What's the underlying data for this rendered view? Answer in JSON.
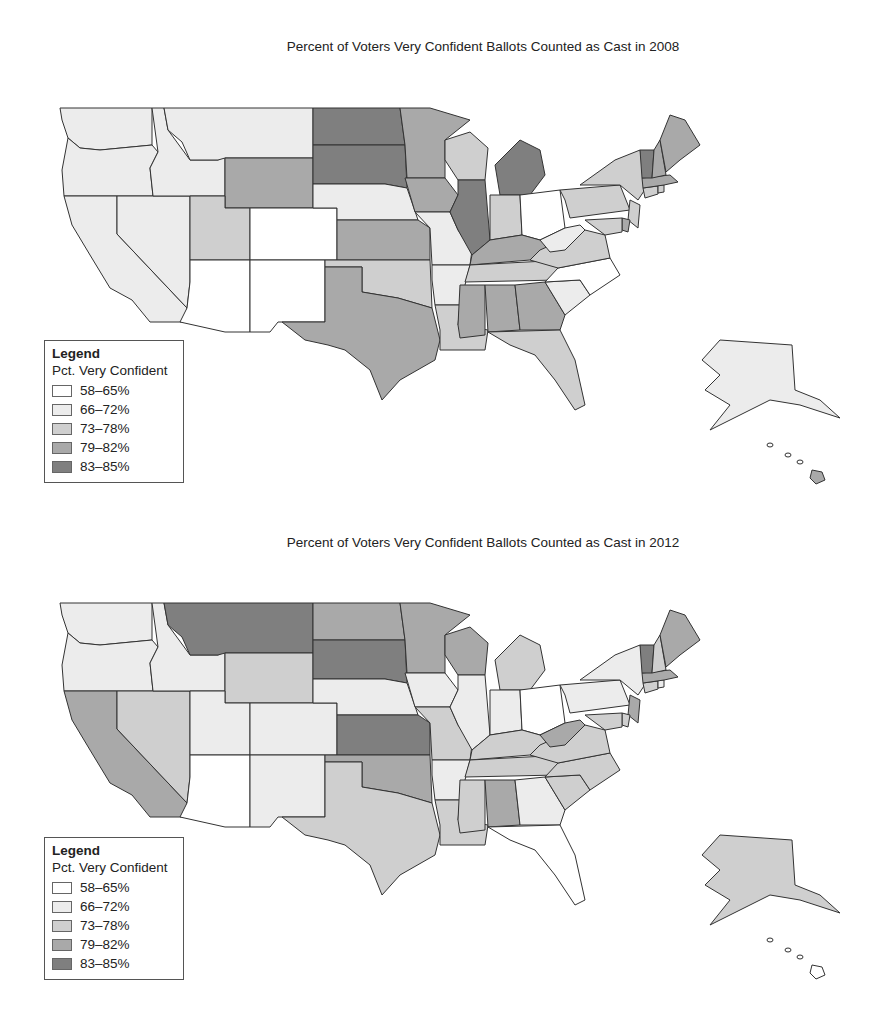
{
  "colors": {
    "c1": "#ffffff",
    "c2": "#ececec",
    "c3": "#cfcfcf",
    "c4": "#a9a9a9",
    "c5": "#7f7f7f",
    "stroke": "#333333"
  },
  "legend": {
    "title": "Legend",
    "subtitle": "Pct. Very Confident",
    "items": [
      {
        "label": "58–65%",
        "cls": "c1"
      },
      {
        "label": "66–72%",
        "cls": "c2"
      },
      {
        "label": "73–78%",
        "cls": "c3"
      },
      {
        "label": "79–82%",
        "cls": "c4"
      },
      {
        "label": "83–85%",
        "cls": "c5"
      }
    ]
  },
  "chart_data": [
    {
      "type": "choropleth",
      "title": "Percent of Voters Very Confident Ballots Counted as Cast in 2008",
      "legend_title": "Legend",
      "legend_subtitle": "Pct. Very Confident",
      "bins": [
        "58–65%",
        "66–72%",
        "73–78%",
        "79–82%",
        "83–85%"
      ],
      "states": {
        "WA": "c2",
        "OR": "c2",
        "CA": "c2",
        "NV": "c2",
        "ID": "c2",
        "MT": "c2",
        "WY": "c4",
        "UT": "c3",
        "CO": "c1",
        "AZ": "c1",
        "NM": "c1",
        "ND": "c5",
        "SD": "c5",
        "NE": "c2",
        "KS": "c4",
        "OK": "c3",
        "TX": "c4",
        "MN": "c4",
        "IA": "c4",
        "MO": "c2",
        "AR": "c2",
        "LA": "c3",
        "WI": "c3",
        "IL": "c5",
        "MI": "c5",
        "IN": "c3",
        "OH": "c1",
        "KY": "c4",
        "TN": "c3",
        "MS": "c4",
        "AL": "c4",
        "GA": "c4",
        "FL": "c3",
        "SC": "c2",
        "NC": "c1",
        "VA": "c3",
        "WV": "c2",
        "PA": "c3",
        "NY": "c3",
        "NJ": "c3",
        "DE": "c4",
        "MD": "c3",
        "CT": "c3",
        "RI": "c3",
        "MA": "c4",
        "VT": "c5",
        "NH": "c4",
        "ME": "c4",
        "AK": "c2",
        "HI": "c4"
      }
    },
    {
      "type": "choropleth",
      "title": "Percent of Voters Very Confident Ballots Counted as Cast in 2012",
      "legend_title": "Legend",
      "legend_subtitle": "Pct. Very Confident",
      "bins": [
        "58–65%",
        "66–72%",
        "73–78%",
        "79–82%",
        "83–85%"
      ],
      "states": {
        "WA": "c2",
        "OR": "c2",
        "CA": "c4",
        "NV": "c3",
        "ID": "c2",
        "MT": "c5",
        "WY": "c3",
        "UT": "c2",
        "CO": "c2",
        "AZ": "c1",
        "NM": "c2",
        "ND": "c4",
        "SD": "c5",
        "NE": "c2",
        "KS": "c5",
        "OK": "c4",
        "TX": "c3",
        "MN": "c4",
        "IA": "c2",
        "MO": "c3",
        "AR": "c2",
        "LA": "c3",
        "WI": "c4",
        "IL": "c2",
        "MI": "c3",
        "IN": "c2",
        "OH": "c1",
        "KY": "c3",
        "TN": "c3",
        "MS": "c3",
        "AL": "c4",
        "GA": "c2",
        "FL": "c1",
        "SC": "c3",
        "NC": "c3",
        "VA": "c3",
        "WV": "c4",
        "PA": "c2",
        "NY": "c2",
        "NJ": "c4",
        "DE": "c3",
        "MD": "c3",
        "CT": "c3",
        "RI": "c2",
        "MA": "c4",
        "VT": "c5",
        "NH": "c3",
        "ME": "c4",
        "AK": "c3",
        "HI": "c1"
      }
    }
  ],
  "maps": [
    {
      "title": "Percent of Voters Very Confident Ballots Counted as Cast in 2008"
    },
    {
      "title": "Percent of Voters Very Confident Ballots Counted as Cast in 2012"
    }
  ]
}
